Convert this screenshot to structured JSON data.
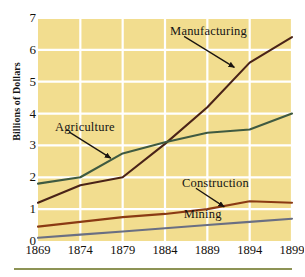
{
  "chart_data": {
    "type": "line",
    "title": "",
    "xlabel": "",
    "ylabel": "Billions of Dollars",
    "categories": [
      "1869",
      "1874",
      "1879",
      "1884",
      "1889",
      "1894",
      "1899"
    ],
    "x": [
      1869,
      1874,
      1879,
      1884,
      1889,
      1894,
      1899
    ],
    "xlim": [
      1869,
      1899
    ],
    "ylim": [
      0,
      7
    ],
    "yticks": [
      0,
      1,
      2,
      3,
      4,
      5,
      6,
      7
    ],
    "grid": true,
    "legend_position": "inline-annotations",
    "series": [
      {
        "name": "Manufacturing",
        "color": "#4a2318",
        "values": [
          1.2,
          1.75,
          2.0,
          3.05,
          4.2,
          5.6,
          6.4
        ]
      },
      {
        "name": "Agriculture",
        "color": "#3f5a41",
        "values": [
          1.8,
          2.0,
          2.75,
          3.1,
          3.4,
          3.5,
          4.0
        ]
      },
      {
        "name": "Construction",
        "color": "#8a3a13",
        "values": [
          0.45,
          0.6,
          0.75,
          0.85,
          1.0,
          1.25,
          1.2
        ]
      },
      {
        "name": "Mining",
        "color": "#6a6f83",
        "values": [
          0.1,
          0.2,
          0.3,
          0.4,
          0.5,
          0.6,
          0.7
        ]
      }
    ],
    "annotations": [
      {
        "text": "Manufacturing",
        "label_x": 1884.6,
        "label_y": 6.55,
        "arrow_to_x": 1892.2,
        "arrow_to_y": 5.45
      },
      {
        "text": "Agriculture",
        "label_x": 1871.0,
        "label_y": 3.55,
        "arrow_to_x": 1877.6,
        "arrow_to_y": 2.6
      },
      {
        "text": "Construction",
        "label_x": 1886.0,
        "label_y": 1.78,
        "arrow_to_x": 1891.0,
        "arrow_to_y": 1.07
      },
      {
        "text": "Mining",
        "label_x": 1886.2,
        "label_y": 0.82,
        "arrow_to_x": null,
        "arrow_to_y": null
      }
    ],
    "colors": {
      "plot_background": "#f2dd8f",
      "gridline": "#ffffff",
      "page_background": "#ffffff",
      "bottom_rule": "#8d9355",
      "tick_text": "#12100c"
    }
  }
}
